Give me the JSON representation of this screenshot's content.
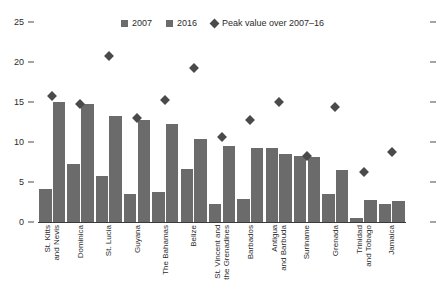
{
  "chart_data": {
    "type": "bar",
    "title": "",
    "subtitle": "",
    "xlabel": "",
    "ylabel": "",
    "ylim": [
      0,
      25
    ],
    "yticks": [
      0,
      5,
      10,
      15,
      20,
      25
    ],
    "grid": false,
    "legend_position": "top-center",
    "categories": [
      "St. Kitts\nand Nevis",
      "Dominica",
      "St. Lucia",
      "Guyana",
      "The Bahamas",
      "Belize",
      "St. Vincent and\nthe Grenadines",
      "Barbados",
      "Antigua\nand Barbuda",
      "Suriname",
      "Grenada",
      "Trinidad\nand Tobago",
      "Jamaica"
    ],
    "series": [
      {
        "name": "2007",
        "values": [
          4.1,
          7.2,
          5.8,
          3.5,
          3.8,
          6.6,
          2.2,
          2.9,
          9.2,
          8.3,
          3.5,
          0.5,
          2.2
        ]
      },
      {
        "name": "2016",
        "values": [
          15.0,
          14.7,
          13.2,
          12.8,
          12.3,
          10.4,
          9.5,
          9.2,
          8.5,
          8.1,
          6.5,
          2.7,
          2.6
        ]
      }
    ],
    "markers": {
      "name": "Peak value over 2007–16",
      "values": [
        15.7,
        14.7,
        20.7,
        13.0,
        15.3,
        19.2,
        10.6,
        12.8,
        15.0,
        8.3,
        14.4,
        6.2,
        8.7
      ]
    },
    "colors": {
      "bar": "#6b6b6b",
      "marker": "#4a4a4a",
      "axis": "#3a3a3a",
      "text": "#2b2b2b",
      "background": "#ffffff"
    }
  },
  "legend": {
    "items": [
      {
        "label": "2007",
        "icon": "square-swatch-icon"
      },
      {
        "label": "2016",
        "icon": "square-swatch-icon"
      },
      {
        "label": "Peak value over 2007–16",
        "icon": "diamond-marker-icon"
      }
    ]
  },
  "axis": {
    "y_tick_labels": [
      "25",
      "20",
      "15",
      "10",
      "5",
      "0"
    ]
  }
}
